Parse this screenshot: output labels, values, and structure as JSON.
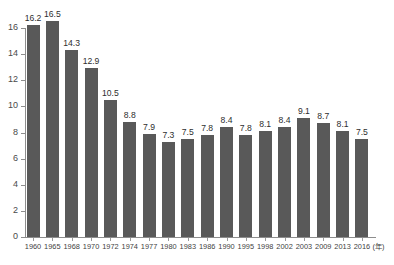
{
  "chart_data": {
    "type": "bar",
    "title": "",
    "subtitle": "",
    "xlabel": "(年)",
    "ylabel": "",
    "categories": [
      "1960",
      "1965",
      "1968",
      "1970",
      "1972",
      "1974",
      "1977",
      "1980",
      "1983",
      "1986",
      "1990",
      "1995",
      "1998",
      "2002",
      "2003",
      "2009",
      "2013",
      "2016"
    ],
    "values": [
      16.2,
      16.5,
      14.3,
      12.9,
      10.5,
      8.8,
      7.9,
      7.3,
      7.5,
      7.8,
      8.4,
      7.8,
      8.1,
      8.4,
      9.1,
      8.7,
      8.1,
      7.5
    ],
    "data_labels": [
      "16.2",
      "16.5",
      "14.3",
      "12.9",
      "10.5",
      "8.8",
      "7.9",
      "7.3",
      "7.5",
      "7.8",
      "8.4",
      "7.8",
      "8.1",
      "8.4",
      "9.1",
      "8.7",
      "8.1",
      "7.5"
    ],
    "ylim": [
      0,
      16
    ],
    "yticks": [
      0,
      2,
      4,
      6,
      8,
      10,
      12,
      14,
      16
    ],
    "ytick_labels": [
      "0",
      "2",
      "4",
      "6",
      "8",
      "10",
      "12",
      "14",
      "16"
    ],
    "grid": false,
    "legend": false,
    "legend_position": "none",
    "bar_color": "#595959",
    "axis_color": "#8d8d8d",
    "background_color": "#ffffff",
    "text_color": "#2e2e2e"
  },
  "axis": {
    "x_unit": "(年)"
  }
}
